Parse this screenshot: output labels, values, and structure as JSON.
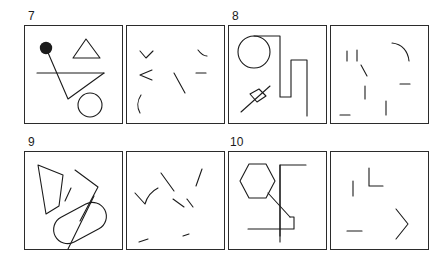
{
  "figure": {
    "kind": "fragmented-figures-perception-test",
    "background_color": "#ffffff",
    "stroke_color": "#1b1b1b",
    "fill_color": "#1b1b1b",
    "panel_border_color": "#2b2b2b",
    "stroke_width": 1,
    "items": [
      {
        "number": "7",
        "complete_panel": {
          "label": "complete-figure-panel",
          "shapes": [
            {
              "name": "filled-dot",
              "type": "circle-filled",
              "cx": 22,
              "cy": 23,
              "r": 6
            },
            {
              "name": "triangle-outline",
              "type": "polygon",
              "points": "62,14 49,33 76,33"
            },
            {
              "name": "horizontal-line",
              "type": "line",
              "x1": 13,
              "y1": 48,
              "x2": 80,
              "y2": 48
            },
            {
              "name": "thin-triangle",
              "type": "polyline",
              "points": "22,23 44,74 80,48"
            },
            {
              "name": "circle-outline",
              "type": "circle-outline",
              "cx": 66,
              "cy": 80,
              "r": 12
            }
          ]
        },
        "fragment_panel": {
          "label": "fragment-panel",
          "fragments": [
            {
              "name": "angle-fragment-upper-left",
              "type": "polyline",
              "points": "14,26 20,33 27,26"
            },
            {
              "name": "arrow-fragment-left",
              "type": "polyline",
              "points": "26,45 14,50 26,55"
            },
            {
              "name": "arc-fragment-lower-left",
              "type": "path",
              "d": "M 15,70 C 11,76 11,83 14,88"
            },
            {
              "name": "diagonal-fragment-center",
              "type": "line",
              "x1": 48,
              "y1": 48,
              "x2": 59,
              "y2": 68
            },
            {
              "name": "short-arc-fragment-upper-right",
              "type": "path",
              "d": "M 72,25 C 75,29 78,31 81,31"
            },
            {
              "name": "dash-fragment-right",
              "type": "line",
              "x1": 70,
              "y1": 48,
              "x2": 80,
              "y2": 48
            }
          ]
        }
      },
      {
        "number": "8",
        "complete_panel": {
          "label": "complete-figure-panel",
          "shapes": [
            {
              "name": "circle-outline",
              "type": "circle-outline",
              "cx": 26,
              "cy": 27,
              "r": 16
            },
            {
              "name": "staircase-polyline",
              "type": "polyline",
              "points": "26,11 52,11 52,72 63,72 63,35 79,35 79,91"
            },
            {
              "name": "diamond-outline",
              "type": "polygon",
              "points": "22,69 31,64 38,71 29,77"
            },
            {
              "name": "diagonal-through-diamond",
              "type": "line",
              "x1": 13,
              "y1": 87,
              "x2": 42,
              "y2": 61
            }
          ]
        },
        "fragment_panel": {
          "label": "fragment-panel",
          "fragments": [
            {
              "name": "vertical-tick-left",
              "type": "line",
              "x1": 17,
              "y1": 26,
              "x2": 17,
              "y2": 36
            },
            {
              "name": "vertical-tick-left-inner",
              "type": "line",
              "x1": 27,
              "y1": 25,
              "x2": 27,
              "y2": 36
            },
            {
              "name": "short-diagonal-fragment",
              "type": "line",
              "x1": 31,
              "y1": 40,
              "x2": 37,
              "y2": 51
            },
            {
              "name": "vertical-tick-center",
              "type": "line",
              "x1": 35,
              "y1": 61,
              "x2": 35,
              "y2": 74
            },
            {
              "name": "dash-fragment-bottom-left",
              "type": "line",
              "x1": 10,
              "y1": 90,
              "x2": 20,
              "y2": 90
            },
            {
              "name": "vertical-tick-bottom-center",
              "type": "line",
              "x1": 56,
              "y1": 76,
              "x2": 56,
              "y2": 90
            },
            {
              "name": "arc-fragment-upper-right",
              "type": "path",
              "d": "M 62,18 C 72,19 78,26 79,36"
            },
            {
              "name": "dash-fragment-right",
              "type": "line",
              "x1": 70,
              "y1": 59,
              "x2": 80,
              "y2": 59
            }
          ]
        }
      },
      {
        "number": "9",
        "complete_panel": {
          "label": "complete-figure-panel",
          "shapes": [
            {
              "name": "quadrilateral-outline",
              "type": "polygon",
              "points": "14,14 39,24 35,55 22,63"
            },
            {
              "name": "short-diagonal-tick",
              "type": "line",
              "x1": 47,
              "y1": 37,
              "x2": 41,
              "y2": 50
            },
            {
              "name": "zigzag-polyline",
              "type": "polyline",
              "points": "51,19 74,36 56,70"
            },
            {
              "name": "pill-outline",
              "type": "stadium",
              "cx": 56,
              "cy": 72,
              "rx": 28,
              "ry": 14,
              "rotate": -28
            },
            {
              "name": "diagonal-through-pill",
              "type": "line",
              "x1": 70,
              "y1": 45,
              "x2": 44,
              "y2": 98
            }
          ]
        },
        "fragment_panel": {
          "label": "fragment-panel",
          "fragments": [
            {
              "name": "hook-fragment-left",
              "type": "path",
              "d": "M 9,42 L 19,53 C 21,46 26,40 32,37"
            },
            {
              "name": "diagonal-fragment-center-upper",
              "type": "line",
              "x1": 35,
              "y1": 22,
              "x2": 48,
              "y2": 40
            },
            {
              "name": "diagonal-fragment-center-lower",
              "type": "line",
              "x1": 47,
              "y1": 48,
              "x2": 58,
              "y2": 56
            },
            {
              "name": "short-diagonal-fragment-right",
              "type": "line",
              "x1": 61,
              "y1": 48,
              "x2": 67,
              "y2": 56
            },
            {
              "name": "diagonal-fragment-upper-right",
              "type": "line",
              "x1": 76,
              "y1": 18,
              "x2": 70,
              "y2": 35
            },
            {
              "name": "dash-fragment-bottom-left",
              "type": "line",
              "x1": 13,
              "y1": 91,
              "x2": 22,
              "y2": 88
            },
            {
              "name": "dash-fragment-bottom-right",
              "type": "line",
              "x1": 57,
              "y1": 85,
              "x2": 63,
              "y2": 83
            }
          ]
        }
      },
      {
        "number": "10",
        "complete_panel": {
          "label": "complete-figure-panel",
          "shapes": [
            {
              "name": "hexagon-outline",
              "type": "polygon",
              "points": "21,13 38,13 47,30 38,47 21,47 12,30"
            },
            {
              "name": "diagonal-connector",
              "type": "line",
              "x1": 40,
              "y1": 42,
              "x2": 62,
              "y2": 66
            },
            {
              "name": "bracket-polyline",
              "type": "polyline",
              "points": "78,14 52,14 52,85"
            },
            {
              "name": "step-polyline",
              "type": "polyline",
              "points": "62,66 66,66 66,78 20,78"
            },
            {
              "name": "vertical-line",
              "type": "line",
              "x1": 52,
              "y1": 14,
              "x2": 52,
              "y2": 91
            }
          ]
        },
        "fragment_panel": {
          "label": "fragment-panel",
          "fragments": [
            {
              "name": "corner-L-fragment",
              "type": "polyline",
              "points": "39,17 39,35 53,35"
            },
            {
              "name": "vertical-tick-left",
              "type": "line",
              "x1": 23,
              "y1": 30,
              "x2": 23,
              "y2": 45
            },
            {
              "name": "dash-fragment-bottom-left",
              "type": "line",
              "x1": 17,
              "y1": 80,
              "x2": 32,
              "y2": 80
            },
            {
              "name": "chevron-right-fragment",
              "type": "polyline",
              "points": "66,58 78,73 66,88"
            }
          ]
        }
      }
    ],
    "layout": {
      "rows": 2,
      "columns": 2,
      "panels_per_item": 2,
      "panel_size_px": 99
    }
  }
}
